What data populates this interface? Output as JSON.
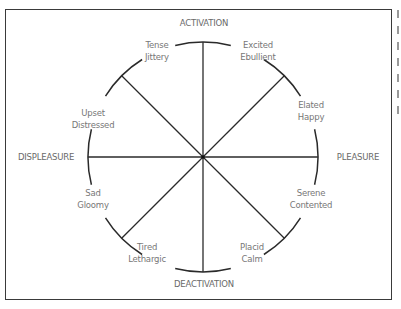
{
  "diagram": {
    "type": "circumplex-of-affect",
    "center": [
      203,
      157
    ],
    "radius": 115,
    "axes": {
      "top": "ACTIVATION",
      "bottom": "DEACTIVATION",
      "left": "DISPLEASURE",
      "right": "PLEASURE"
    },
    "states": [
      {
        "line1": "Tense",
        "line2": "Jittery",
        "x": 157,
        "y": 39
      },
      {
        "line1": "Excited",
        "line2": "Ebullient",
        "x": 258,
        "y": 39
      },
      {
        "line1": "Elated",
        "line2": "Happy",
        "x": 311,
        "y": 99
      },
      {
        "line1": "Upset",
        "line2": "Distressed",
        "x": 93,
        "y": 107
      },
      {
        "line1": "Sad",
        "line2": "Gloomy",
        "x": 93,
        "y": 187
      },
      {
        "line1": "Serene",
        "line2": "Contented",
        "x": 311,
        "y": 187
      },
      {
        "line1": "Tired",
        "line2": "Lethargic",
        "x": 147,
        "y": 241
      },
      {
        "line1": "Placid",
        "line2": "Calm",
        "x": 252,
        "y": 241
      }
    ],
    "colors": {
      "lines": "#2a2a2a",
      "text": "#777777",
      "border": "#3a3a3a"
    }
  }
}
